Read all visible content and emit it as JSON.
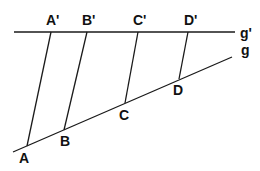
{
  "diagram": {
    "type": "geometry-parallel-projection",
    "colors": {
      "line": "#1a1a1a",
      "text": "#111111",
      "background": "#ffffff"
    },
    "lines": {
      "g_prime": {
        "label": "g'",
        "x1": 14,
        "y1": 32,
        "x2": 235,
        "y2": 32,
        "label_x": 240,
        "label_y": 38
      },
      "g": {
        "label": "g",
        "x1": 13,
        "y1": 152,
        "x2": 232,
        "y2": 57,
        "label_x": 241,
        "label_y": 55
      }
    },
    "points_on_g": [
      {
        "label": "A",
        "x": 27,
        "y": 146,
        "label_x": 19,
        "label_y": 163
      },
      {
        "label": "B",
        "x": 64,
        "y": 130,
        "label_x": 60,
        "label_y": 146
      },
      {
        "label": "C",
        "x": 125,
        "y": 103,
        "label_x": 119,
        "label_y": 120
      },
      {
        "label": "D",
        "x": 179,
        "y": 79,
        "label_x": 173,
        "label_y": 95
      }
    ],
    "points_on_g_prime": [
      {
        "label": "A'",
        "x": 51,
        "y": 32,
        "label_x": 46,
        "label_y": 25
      },
      {
        "label": "B'",
        "x": 87,
        "y": 32,
        "label_x": 82,
        "label_y": 25
      },
      {
        "label": "C'",
        "x": 138,
        "y": 32,
        "label_x": 133,
        "label_y": 25
      },
      {
        "label": "D'",
        "x": 188,
        "y": 32,
        "label_x": 184,
        "label_y": 25
      }
    ]
  }
}
